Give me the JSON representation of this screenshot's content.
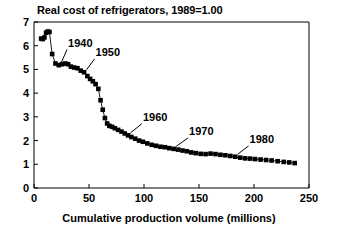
{
  "chart_data": {
    "type": "line",
    "title": "Real cost of refrigerators, 1989=1.00",
    "xlabel": "Cumulative production volume (millions)",
    "ylabel": "",
    "xlim": [
      0,
      250
    ],
    "ylim": [
      0,
      7
    ],
    "xticks": [
      0,
      50,
      100,
      150,
      200,
      250
    ],
    "yticks": [
      0,
      1,
      2,
      3,
      4,
      5,
      6,
      7
    ],
    "xtick_labels": [
      "0",
      "50",
      "100",
      "150",
      "200",
      "250"
    ],
    "ytick_labels": [
      "0",
      "1",
      "2",
      "3",
      "4",
      "5",
      "6",
      "7"
    ],
    "grid": false,
    "legend": "none",
    "marker": "filled-square",
    "series": [
      {
        "name": "Real cost of refrigerators",
        "x": [
          6.5,
          8.0,
          9.5,
          11.0,
          12.5,
          14.0,
          16.5,
          19.5,
          22.5,
          25.5,
          28.5,
          31.0,
          33.5,
          36.5,
          39.5,
          42.5,
          45.5,
          48.5,
          51.0,
          53.5,
          56.0,
          58.5,
          60.5,
          62.5,
          64.5,
          66.5,
          68.5,
          71.0,
          73.5,
          76.5,
          79.5,
          82.5,
          85.5,
          88.5,
          92.0,
          95.5,
          99.0,
          103.0,
          107.0,
          111.0,
          115.0,
          119.0,
          123.0,
          127.0,
          131.0,
          135.0,
          139.0,
          143.0,
          147.0,
          151.5,
          156.0,
          160.5,
          165.0,
          169.5,
          174.0,
          178.5,
          183.0,
          187.5,
          192.0,
          196.5,
          201.0,
          206.0,
          211.0,
          216.0,
          221.5,
          227.0,
          232.0,
          237.0
        ],
        "y": [
          6.3,
          6.28,
          6.35,
          6.55,
          6.6,
          6.58,
          5.65,
          5.25,
          5.18,
          5.22,
          5.25,
          5.22,
          5.12,
          5.08,
          5.05,
          4.95,
          4.88,
          4.72,
          4.6,
          4.5,
          4.38,
          4.18,
          3.7,
          3.3,
          2.95,
          2.72,
          2.62,
          2.58,
          2.52,
          2.45,
          2.38,
          2.3,
          2.22,
          2.15,
          2.08,
          2.0,
          1.95,
          1.88,
          1.82,
          1.78,
          1.74,
          1.72,
          1.68,
          1.65,
          1.62,
          1.58,
          1.55,
          1.5,
          1.47,
          1.44,
          1.43,
          1.45,
          1.43,
          1.4,
          1.38,
          1.35,
          1.32,
          1.28,
          1.25,
          1.24,
          1.22,
          1.2,
          1.18,
          1.16,
          1.13,
          1.1,
          1.08,
          1.05
        ]
      }
    ],
    "annotations": [
      {
        "label": "1940",
        "point_x": 22.5,
        "point_y": 5.18,
        "text_x": 31.0,
        "text_y": 5.95
      },
      {
        "label": "1950",
        "point_x": 45.5,
        "point_y": 4.88,
        "text_x": 56.0,
        "text_y": 5.55
      },
      {
        "label": "1960",
        "point_x": 85.5,
        "point_y": 2.22,
        "text_x": 99.0,
        "text_y": 2.82
      },
      {
        "label": "1970",
        "point_x": 127.0,
        "point_y": 1.65,
        "text_x": 141.0,
        "text_y": 2.22
      },
      {
        "label": "1980",
        "point_x": 183.0,
        "point_y": 1.32,
        "text_x": 196.0,
        "text_y": 1.88
      }
    ]
  }
}
